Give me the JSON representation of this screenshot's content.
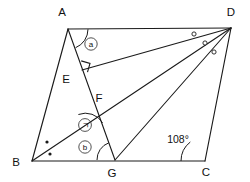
{
  "figure": {
    "vertices": [
      {
        "name": "A",
        "label": "A",
        "x": 68,
        "y": 29,
        "label_x": 62,
        "label_y": 16
      },
      {
        "name": "B",
        "label": "B",
        "x": 32,
        "y": 161,
        "label_x": 16,
        "label_y": 166
      },
      {
        "name": "C",
        "label": "C",
        "x": 205,
        "y": 161,
        "label_x": 206,
        "label_y": 176
      },
      {
        "name": "D",
        "label": "D",
        "x": 231,
        "y": 28,
        "label_x": 231,
        "label_y": 16
      },
      {
        "name": "E",
        "label": "E",
        "x": 82,
        "y": 70,
        "label_x": 66,
        "label_y": 83
      },
      {
        "name": "F",
        "label": "F",
        "x": 96,
        "y": 103,
        "label_x": 94,
        "label_y": 100
      },
      {
        "name": "G",
        "label": "G",
        "x": 115,
        "y": 160,
        "label_x": 110,
        "label_y": 176
      }
    ],
    "segments": [
      {
        "name": "segment-AB",
        "from": "A",
        "to": "B"
      },
      {
        "name": "segment-AD",
        "from": "A",
        "to": "D"
      },
      {
        "name": "segment-BC",
        "from": "B",
        "to": "C"
      },
      {
        "name": "segment-DC",
        "from": "D",
        "to": "C"
      },
      {
        "name": "segment-AG",
        "from": "A",
        "to": "G"
      },
      {
        "name": "segment-ED",
        "from": "E",
        "to": "D"
      },
      {
        "name": "segment-BD",
        "from": "B",
        "to": "D"
      },
      {
        "name": "segment-GD",
        "from": "G",
        "to": "D"
      }
    ],
    "angle_labels": {
      "angle_a": "ⓐ",
      "angle_a_plain": "a",
      "angle_b": "ⓑ",
      "angle_b_plain": "b",
      "angle_gi": "㉠",
      "angle_gi_plain": "ㄱ",
      "angle_c_value": "108°"
    },
    "markers": {
      "right_angle_at": "E",
      "equal_dots_at": "B",
      "equal_dots_count": 2,
      "equal_circles_at": "D",
      "equal_circles_count": 3
    }
  },
  "colors": {
    "stroke": "#1a1a1a",
    "background": "#ffffff",
    "text": "#111111"
  }
}
